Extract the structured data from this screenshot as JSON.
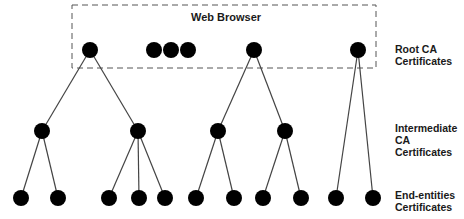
{
  "browser_box": {
    "title": "Web Browser",
    "x": 72,
    "y": 5,
    "width": 304,
    "height": 63
  },
  "levels": [
    {
      "id": "root",
      "line1": "Root CA",
      "line2": "Certificates",
      "y": 50
    },
    {
      "id": "intermediate",
      "line1": "Intermediate",
      "line2": "CA Certificates",
      "y": 131
    },
    {
      "id": "end",
      "line1": "End-entities",
      "line2": "Certificates",
      "y": 198
    }
  ],
  "nodes": {
    "roots": [
      {
        "id": "r1",
        "x": 90,
        "y": 50
      },
      {
        "id": "r2",
        "x": 154,
        "y": 50
      },
      {
        "id": "r3",
        "x": 171,
        "y": 50
      },
      {
        "id": "r4",
        "x": 188,
        "y": 50
      },
      {
        "id": "r5",
        "x": 254,
        "y": 50
      },
      {
        "id": "r6",
        "x": 358,
        "y": 50
      }
    ],
    "intermediates": [
      {
        "id": "i1",
        "x": 42,
        "y": 131
      },
      {
        "id": "i2",
        "x": 138,
        "y": 131
      },
      {
        "id": "i3",
        "x": 218,
        "y": 131
      },
      {
        "id": "i4",
        "x": 285,
        "y": 131
      }
    ],
    "leaves": [
      {
        "id": "l1",
        "x": 21,
        "y": 198
      },
      {
        "id": "l2",
        "x": 58,
        "y": 198
      },
      {
        "id": "l3",
        "x": 109,
        "y": 198
      },
      {
        "id": "l4",
        "x": 139,
        "y": 198
      },
      {
        "id": "l5",
        "x": 165,
        "y": 198
      },
      {
        "id": "l6",
        "x": 196,
        "y": 198
      },
      {
        "id": "l7",
        "x": 234,
        "y": 198
      },
      {
        "id": "l8",
        "x": 263,
        "y": 198
      },
      {
        "id": "l9",
        "x": 301,
        "y": 198
      },
      {
        "id": "l10",
        "x": 336,
        "y": 198
      },
      {
        "id": "l11",
        "x": 373,
        "y": 198
      }
    ]
  },
  "edges": [
    [
      "r1",
      "i1"
    ],
    [
      "r1",
      "i2"
    ],
    [
      "r5",
      "i3"
    ],
    [
      "r5",
      "i4"
    ],
    [
      "r6",
      "l10"
    ],
    [
      "r6",
      "l11"
    ],
    [
      "i1",
      "l1"
    ],
    [
      "i1",
      "l2"
    ],
    [
      "i2",
      "l3"
    ],
    [
      "i2",
      "l4"
    ],
    [
      "i2",
      "l5"
    ],
    [
      "i3",
      "l6"
    ],
    [
      "i3",
      "l7"
    ],
    [
      "i4",
      "l8"
    ],
    [
      "i4",
      "l9"
    ]
  ],
  "style": {
    "node_color": "#000000",
    "edge_color": "#444444",
    "box_color": "#555555",
    "node_radius": 8
  }
}
